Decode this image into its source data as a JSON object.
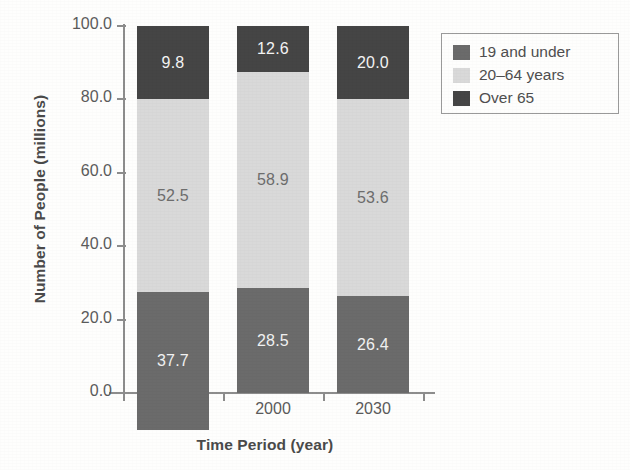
{
  "chart_data": {
    "type": "bar",
    "subtype": "stacked-bar",
    "title": "",
    "xlabel": "Time Period (year)",
    "ylabel": "Number of People (millions)",
    "categories": [
      "1970",
      "2000",
      "2030"
    ],
    "series": [
      {
        "name": "19 and under",
        "color": "#6b6b6b",
        "values": [
          37.7,
          28.5,
          26.4
        ],
        "labels": [
          "37.7",
          "28.5",
          "26.4"
        ]
      },
      {
        "name": "20–64 years",
        "color": "#d9d9d9",
        "values": [
          52.5,
          58.9,
          53.6
        ],
        "labels": [
          "52.5",
          "58.9",
          "53.6"
        ]
      },
      {
        "name": "Over 65",
        "color": "#454545",
        "values": [
          9.8,
          12.6,
          20.0
        ],
        "labels": [
          "9.8",
          "12.6",
          "20.0"
        ]
      }
    ],
    "stack_order_bottom_to_top": [
      "19 and under",
      "20–64 years",
      "Over 65"
    ],
    "ylim": [
      0,
      100
    ],
    "yticks": [
      0,
      20,
      40,
      60,
      80,
      100
    ],
    "ytick_labels": [
      "0.0",
      "20.0",
      "40.0",
      "60.0",
      "80.0",
      "100.0"
    ],
    "grid": false,
    "legend_position": "upper-right-outside",
    "legend_entries": [
      "19 and under",
      "20–64 years",
      "Over 65"
    ]
  },
  "axes": {
    "y_title": "Number of People (millions)",
    "x_title": "Time Period (year)",
    "y_ticks": [
      {
        "value": 100,
        "label": "100.0"
      },
      {
        "value": 80,
        "label": "80.0"
      },
      {
        "value": 60,
        "label": "60.0"
      },
      {
        "value": 40,
        "label": "40.0"
      },
      {
        "value": 20,
        "label": "20.0"
      },
      {
        "value": 0,
        "label": "0.0"
      }
    ],
    "x_ticks": [
      {
        "label": "1970"
      },
      {
        "label": "2000"
      },
      {
        "label": "2030"
      }
    ]
  },
  "bars": [
    {
      "category": "1970",
      "segments": [
        {
          "series": "Over 65",
          "value": 20.0,
          "label": "9.8"
        },
        {
          "series": "20–64 years",
          "value": 52.5,
          "label": "52.5"
        },
        {
          "series": "19 and under",
          "value": 37.7,
          "label": "37.7"
        }
      ]
    },
    {
      "category": "2000",
      "segments": [
        {
          "series": "Over 65",
          "value": 12.6,
          "label": "12.6"
        },
        {
          "series": "20–64 years",
          "value": 58.9,
          "label": "58.9"
        },
        {
          "series": "19 and under",
          "value": 28.5,
          "label": "28.5"
        }
      ]
    },
    {
      "category": "2030",
      "segments": [
        {
          "series": "Over 65",
          "value": 20.0,
          "label": "20.0"
        },
        {
          "series": "20–64 years",
          "value": 53.6,
          "label": "53.6"
        },
        {
          "series": "19 and under",
          "value": 26.4,
          "label": "26.4"
        }
      ]
    }
  ],
  "legend": {
    "items": [
      {
        "label": "19 and under",
        "color": "#6b6b6b"
      },
      {
        "label": "20–64 years",
        "color": "#d9d9d9"
      },
      {
        "label": "Over 65",
        "color": "#454545"
      }
    ]
  },
  "colors": {
    "under19": "#6b6b6b",
    "age2064": "#d9d9d9",
    "over65": "#454545",
    "axis": "#8d8d8d",
    "text": "#4f4f4f",
    "background": "#fefefd"
  }
}
